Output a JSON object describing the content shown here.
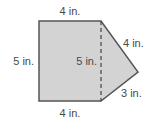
{
  "figure": {
    "shape": "composite figure: rectangle plus triangle",
    "fill_color": "#d3d3d3",
    "stroke_color": "#555555",
    "label_color": "#4a4a4a",
    "labels": {
      "top": "4 in.",
      "left": "5 in.",
      "bottom": "4 in.",
      "dashed_height": "5 in.",
      "triangle_upper": "4 in.",
      "triangle_lower": "3 in."
    }
  }
}
